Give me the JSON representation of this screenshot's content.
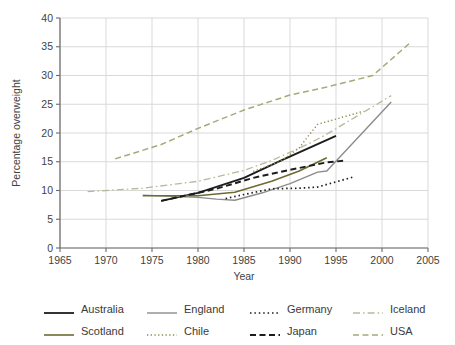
{
  "chart_data": {
    "type": "line",
    "title": "",
    "xlabel": "Year",
    "ylabel": "Percentage overweight",
    "xlim": [
      1965,
      2005
    ],
    "ylim": [
      0,
      40
    ],
    "xticks": [
      1965,
      1970,
      1975,
      1980,
      1985,
      1990,
      1995,
      2000,
      2005
    ],
    "yticks": [
      0,
      5,
      10,
      15,
      20,
      25,
      30,
      35,
      40
    ],
    "grid": true,
    "legend_position": "below",
    "series": [
      {
        "name": "Australia",
        "color": "#1c1c1c",
        "style": "solid",
        "width": 1.8,
        "x": [
          1976,
          1980,
          1985,
          1989,
          1995
        ],
        "values": [
          8.2,
          9.6,
          12.2,
          15.2,
          19.5
        ]
      },
      {
        "name": "England",
        "color": "#8c8c8c",
        "style": "solid",
        "width": 1.4,
        "x": [
          1974,
          1980,
          1982,
          1984,
          1987,
          1990,
          1993,
          1994,
          2001
        ],
        "values": [
          9.2,
          8.8,
          8.5,
          8.3,
          9.6,
          11.2,
          13.2,
          13.4,
          25.4
        ]
      },
      {
        "name": "Germany",
        "color": "#1c1c1c",
        "style": "dotted",
        "width": 1.7,
        "x": [
          1983,
          1985,
          1988,
          1991,
          1993,
          1997
        ],
        "values": [
          8.6,
          9.3,
          10.3,
          10.4,
          10.6,
          12.4
        ]
      },
      {
        "name": "Iceland",
        "color": "#b9b89a",
        "style": "dashdot",
        "width": 1.3,
        "x": [
          1968,
          1974,
          1980,
          1985,
          1988,
          1992,
          1994,
          2001
        ],
        "values": [
          9.8,
          10.4,
          11.6,
          13.5,
          15.2,
          18.1,
          19.8,
          26.5
        ]
      },
      {
        "name": "Scotland",
        "color": "#6b6b33",
        "style": "solid",
        "width": 1.6,
        "x": [
          1974,
          1980,
          1984,
          1988,
          1991,
          1994
        ],
        "values": [
          9.1,
          9.1,
          9.7,
          11.6,
          13.4,
          15.7
        ]
      },
      {
        "name": "Chile",
        "color": "#8e8e52",
        "style": "dotted",
        "width": 1.4,
        "x": [
          1986,
          1989,
          1991,
          1992,
          1993,
          1998
        ],
        "values": [
          13.3,
          15.1,
          17.4,
          19.5,
          21.5,
          23.8
        ]
      },
      {
        "name": "Japan",
        "color": "#1c1c1c",
        "style": "dashed",
        "width": 1.9,
        "x": [
          1976,
          1982,
          1986,
          1990,
          1994,
          1996
        ],
        "values": [
          8.2,
          10.3,
          12.2,
          13.6,
          14.9,
          15.2
        ]
      },
      {
        "name": "USA",
        "color": "#a8a878",
        "style": "dashed",
        "width": 1.5,
        "x": [
          1971,
          1976,
          1980,
          1985,
          1990,
          1994,
          1999,
          2003
        ],
        "values": [
          15.5,
          18.0,
          20.8,
          24.0,
          26.6,
          28.0,
          30.0,
          35.6
        ]
      }
    ]
  },
  "legend": {
    "rows": [
      [
        {
          "label": "Australia",
          "series": "Australia"
        },
        {
          "label": "England",
          "series": "England"
        },
        {
          "label": "Germany",
          "series": "Germany"
        },
        {
          "label": "Iceland",
          "series": "Iceland"
        }
      ],
      [
        {
          "label": "Scotland",
          "series": "Scotland"
        },
        {
          "label": "Chile",
          "series": "Chile"
        },
        {
          "label": "Japan",
          "series": "Japan"
        },
        {
          "label": "USA",
          "series": "USA"
        }
      ]
    ]
  }
}
